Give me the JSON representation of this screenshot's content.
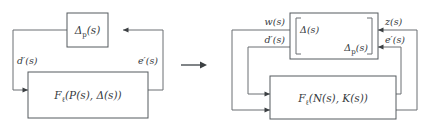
{
  "figure": {
    "transform_arrow": "→",
    "colors": {
      "line": "#555a5e",
      "signal": "#6a6f73",
      "arrow": "#3c4043",
      "text": "#35393d",
      "background": "#ffffff"
    }
  },
  "left_diagram": {
    "name": "original-interconnection",
    "blocks": [
      {
        "id": "delta-p-block",
        "label_base": "Δ",
        "label_sub": "p",
        "label_arg": "(s)",
        "label_full": "Δₚ(s)"
      },
      {
        "id": "lft-p-delta-block",
        "label_f": "F",
        "label_f_sub": "ℓ",
        "label_args": "(P(s), Δ(s))",
        "label_full": "Fℓ(P(s), Δ(s))"
      }
    ],
    "signals": [
      {
        "id": "d-prime",
        "label": "d′(s)"
      },
      {
        "id": "e-prime",
        "label": "e′(s)"
      }
    ]
  },
  "right_diagram": {
    "name": "transformed-interconnection",
    "blocks": [
      {
        "id": "block-diagonal-delta",
        "entry_top": "Δ(s)",
        "entry_top_base": "Δ",
        "entry_top_arg": "(s)",
        "entry_bottom_base": "Δ",
        "entry_bottom_sub": "p",
        "entry_bottom_arg": "(s)",
        "entry_bottom": "Δₚ(s)"
      },
      {
        "id": "lft-n-k-block",
        "label_f": "F",
        "label_f_sub": "ℓ",
        "label_args": "(N(s), K(s))",
        "label_full": "Fℓ(N(s), K(s))"
      }
    ],
    "signals": [
      {
        "id": "w",
        "label": "w(s)"
      },
      {
        "id": "d-prime",
        "label": "d′(s)"
      },
      {
        "id": "z",
        "label": "z(s)"
      },
      {
        "id": "e-prime",
        "label": "e′(s)"
      }
    ]
  }
}
